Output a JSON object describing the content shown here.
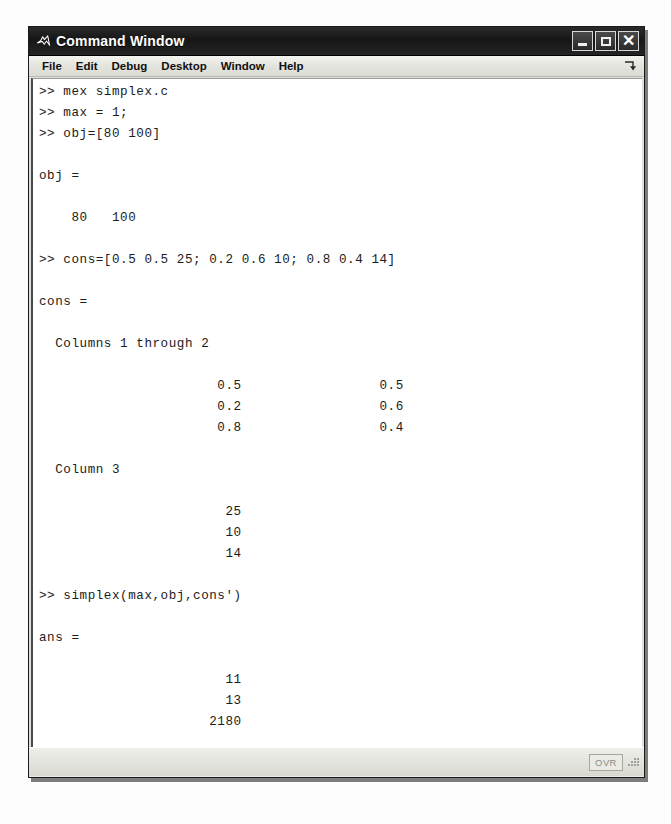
{
  "window": {
    "title": "Command Window",
    "icon": "matlab-icon"
  },
  "menu": {
    "items": [
      "File",
      "Edit",
      "Debug",
      "Desktop",
      "Window",
      "Help"
    ],
    "undock_icon": "undock-arrow-icon"
  },
  "console": {
    "prompt": ">>",
    "transcript": ">> mex simplex.c\n>> max = 1;\n>> obj=[80 100]\n\nobj =\n\n    80   100\n\n>> cons=[0.5 0.5 25; 0.2 0.6 10; 0.8 0.4 14]\n\ncons =\n\n  Columns 1 through 2\n\n                      0.5                 0.5\n                      0.2                 0.6\n                      0.8                 0.4\n\n  Column 3\n\n                       25\n                       10\n                       14\n\n>> simplex(max,obj,cons')\n\nans =\n\n                       11\n                       13\n                     2180\n\n>> ",
    "lines": [
      ">> mex simplex.c",
      ">> max = 1;",
      ">> obj=[80 100]",
      "",
      "obj =",
      "",
      "    80   100",
      "",
      ">> cons=[0.5 0.5 25; 0.2 0.6 10; 0.8 0.4 14]",
      "",
      "cons =",
      "",
      "  Columns 1 through 2",
      "",
      "                      0.5                 0.5",
      "                      0.2                 0.6",
      "                      0.8                 0.4",
      "",
      "  Column 3",
      "",
      "                       25",
      "                       10",
      "                       14",
      "",
      ">> simplex(max,obj,cons')",
      "",
      "ans =",
      "",
      "                       11",
      "                       13",
      "                     2180",
      "",
      ">> "
    ],
    "commands": [
      "mex simplex.c",
      "max = 1;",
      "obj=[80 100]",
      "cons=[0.5 0.5 25; 0.2 0.6 10; 0.8 0.4 14]",
      "simplex(max,obj,cons')"
    ],
    "variables": {
      "obj": [
        80,
        100
      ],
      "cons_columns_1_through_2": [
        [
          0.5,
          0.5
        ],
        [
          0.2,
          0.6
        ],
        [
          0.8,
          0.4
        ]
      ],
      "cons_column_3": [
        25,
        10,
        14
      ],
      "ans": [
        11,
        13,
        2180
      ]
    },
    "labels": {
      "obj": "obj =",
      "cons": "cons =",
      "ans": "ans =",
      "columns_1_2": "Columns 1 through 2",
      "column_3": "Column 3"
    }
  },
  "status": {
    "overwrite_label": "OVR",
    "resize_grip": "resize-grip-icon"
  },
  "colors": {
    "titlebar": "#1d1d1d",
    "titlebar_text": "#ffffff",
    "menubar": "#e6e6e0",
    "console_background": "#ffffff",
    "console_text": "#1b1b1b",
    "statusbar": "#e4e4de",
    "window_border": "#1a1a1a"
  }
}
